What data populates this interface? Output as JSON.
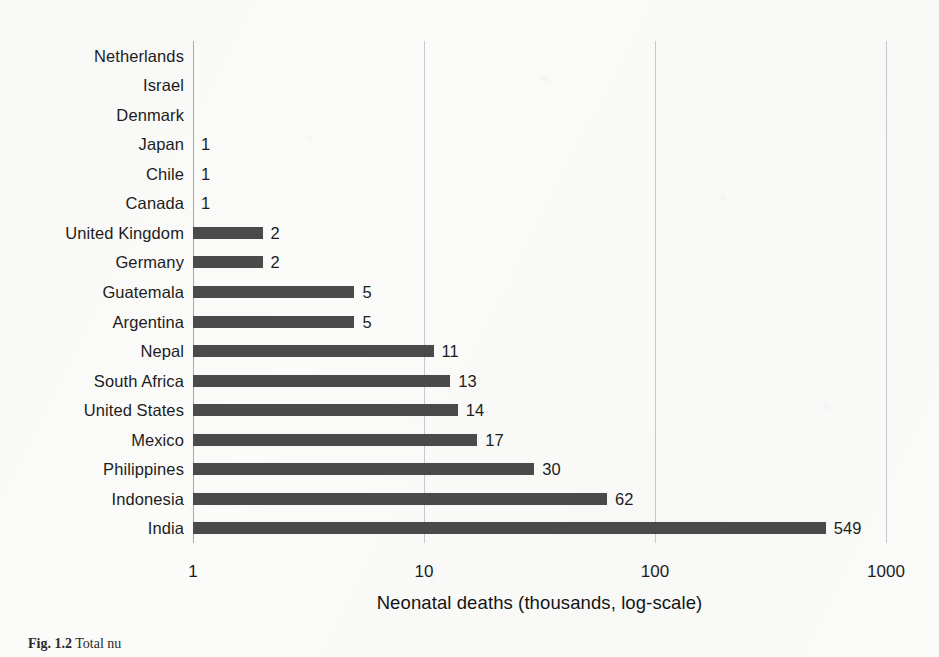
{
  "figure": {
    "caption_label": "Fig. 1.2",
    "caption_text": "Total nu"
  },
  "chart_data": {
    "type": "bar",
    "orientation": "horizontal",
    "title": "",
    "xlabel": "Neonatal deaths (thousands, log-scale)",
    "ylabel": "",
    "xscale": "log",
    "xlim": [
      1,
      1000
    ],
    "xticks": [
      "1",
      "10",
      "100",
      "1000"
    ],
    "xtick_values": [
      1,
      10,
      100,
      1000
    ],
    "grid": "vertical",
    "legend": "none",
    "bar_color": "#4a4a4a",
    "categories": [
      "Netherlands",
      "Israel",
      "Denmark",
      "Japan",
      "Chile",
      "Canada",
      "United Kingdom",
      "Germany",
      "Guatemala",
      "Argentina",
      "Nepal",
      "South Africa",
      "United States",
      "Mexico",
      "Philippines",
      "Indonesia",
      "India"
    ],
    "values": [
      null,
      null,
      null,
      1,
      1,
      1,
      2,
      2,
      5,
      5,
      11,
      13,
      14,
      17,
      30,
      62,
      549
    ],
    "data_labels": [
      "",
      "",
      "",
      "1",
      "1",
      "1",
      "2",
      "2",
      "5",
      "5",
      "11",
      "13",
      "14",
      "17",
      "30",
      "62",
      "549"
    ]
  }
}
